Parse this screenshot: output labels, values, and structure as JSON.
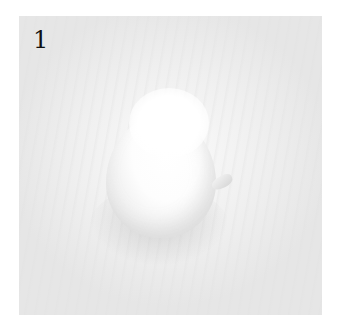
{
  "figure": {
    "label": "1",
    "colors": {
      "background": "#ffffff",
      "surface": "#ededed",
      "object": "#fbfbfb",
      "label_text": "#111111"
    }
  }
}
